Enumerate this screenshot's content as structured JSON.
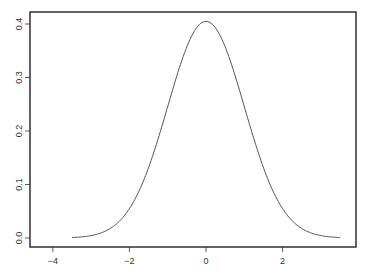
{
  "chart_data": {
    "type": "line",
    "title": "",
    "xlabel": "",
    "ylabel": "",
    "xlim": [
      -4.4,
      3.9
    ],
    "ylim": [
      -0.017,
      0.425
    ],
    "grid": false,
    "legend": null,
    "x_ticks": [
      -4,
      -2,
      0,
      2
    ],
    "x_tick_labels": [
      "−4",
      "−2",
      "0",
      "2"
    ],
    "y_ticks": [
      0.0,
      0.1,
      0.2,
      0.3,
      0.4
    ],
    "y_tick_labels": [
      "0.0",
      "0.1",
      "0.2",
      "0.3",
      "0.4"
    ],
    "series": [
      {
        "name": "density",
        "color": "#555555",
        "x": [
          -3.5,
          -3.0,
          -2.5,
          -2.0,
          -1.5,
          -1.0,
          -0.5,
          0.0,
          0.5,
          1.0,
          1.5,
          2.0,
          2.5,
          3.0,
          3.5
        ],
        "values": [
          0.001,
          0.004,
          0.018,
          0.054,
          0.13,
          0.242,
          0.352,
          0.405,
          0.352,
          0.242,
          0.13,
          0.054,
          0.018,
          0.004,
          0.001
        ]
      }
    ]
  },
  "plot": {
    "frame": {
      "left": 30,
      "top": 12,
      "right": 356,
      "bottom": 247
    },
    "axis_color": "#222222",
    "curve_color": "#555555"
  }
}
